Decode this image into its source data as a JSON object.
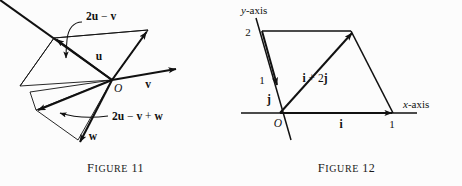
{
  "page": {
    "background_color": "#fcfcfc",
    "ink_color": "#111111",
    "width": 462,
    "height": 186
  },
  "figure11": {
    "caption_word": "Figure",
    "caption_number": "11",
    "caption_full": "FIGURE 11",
    "labels": {
      "two_u_minus_v": "2u − v",
      "two_u_minus_v_plus_w": "2u − v + w",
      "u": "u",
      "v": "v",
      "w": "w",
      "origin": "O"
    },
    "vectors": [
      {
        "name": "u",
        "label": "u",
        "from": "O",
        "direction": "up-right"
      },
      {
        "name": "v",
        "label": "v",
        "from": "O",
        "direction": "right"
      },
      {
        "name": "w",
        "label": "w",
        "from": "2u-v",
        "direction": "down"
      },
      {
        "name": "2u-v",
        "label": "2u − v",
        "from": "O",
        "direction": "up-left"
      },
      {
        "name": "2u-v+w",
        "label": "2u − v + w",
        "from": "O",
        "direction": "down-left"
      }
    ]
  },
  "figure12": {
    "caption_word": "Figure",
    "caption_number": "12",
    "caption_full": "FIGURE 12",
    "labels": {
      "y_axis": "y-axis",
      "y_axis_italic_part": "y",
      "y_axis_rest": "-axis",
      "x_axis": "x-axis",
      "x_axis_italic_part": "x",
      "x_axis_rest": "-axis",
      "origin": "O",
      "i": "i",
      "j": "j",
      "i_plus_2j": "i + 2j",
      "tick_y_2": "2",
      "tick_y_1": "1",
      "tick_x_1": "1"
    },
    "vectors": [
      {
        "name": "i",
        "label": "i",
        "from": "O",
        "to_tick": "1",
        "axis": "x-axis"
      },
      {
        "name": "j",
        "label": "j",
        "from": "O",
        "to_tick": "1",
        "axis": "y-axis"
      },
      {
        "name": "i+2j",
        "label": "i + 2j",
        "from": "O",
        "components": "1 i + 2 j"
      }
    ],
    "axes": {
      "x_ticks": [
        "1"
      ],
      "y_ticks": [
        "1",
        "2"
      ],
      "y_axis_oblique": true
    }
  }
}
